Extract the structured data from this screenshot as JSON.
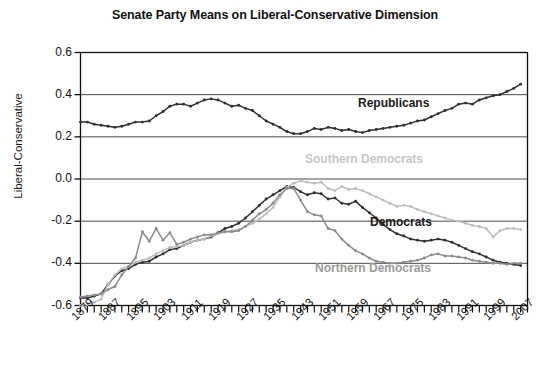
{
  "chart_data": {
    "type": "line",
    "title": "Senate Party Means on Liberal-Conservative Dimension",
    "xlabel": "",
    "ylabel": "Liberal-Conservative",
    "ylim": [
      -0.6,
      0.6
    ],
    "yticks": [
      "0.6",
      "0.4",
      "0.2",
      "0.0",
      "-0.2",
      "-0.4",
      "-0.6"
    ],
    "ytick_values": [
      0.6,
      0.4,
      0.2,
      0.0,
      -0.2,
      -0.4,
      -0.6
    ],
    "xlim": [
      1879,
      2009
    ],
    "xtick_labels": [
      "1879",
      "1887",
      "1895",
      "1903",
      "1911",
      "1919",
      "1927",
      "1935",
      "1943",
      "1951",
      "1959",
      "1967",
      "1975",
      "1983",
      "1991",
      "1999",
      "2007"
    ],
    "xtick_values": [
      1879,
      1887,
      1895,
      1903,
      1911,
      1919,
      1927,
      1935,
      1943,
      1951,
      1959,
      1967,
      1975,
      1983,
      1991,
      1999,
      2007
    ],
    "x_step_years": 2,
    "grid": "horizontal",
    "legend_position": "inline-annotations",
    "markers": "small-filled-circles",
    "x": [
      1879,
      1881,
      1883,
      1885,
      1887,
      1889,
      1891,
      1893,
      1895,
      1897,
      1899,
      1901,
      1903,
      1905,
      1907,
      1909,
      1911,
      1913,
      1915,
      1917,
      1919,
      1921,
      1923,
      1925,
      1927,
      1929,
      1931,
      1933,
      1935,
      1937,
      1939,
      1941,
      1943,
      1945,
      1947,
      1949,
      1951,
      1953,
      1955,
      1957,
      1959,
      1961,
      1963,
      1965,
      1967,
      1969,
      1971,
      1973,
      1975,
      1977,
      1979,
      1981,
      1983,
      1985,
      1987,
      1989,
      1991,
      1993,
      1995,
      1997,
      1999,
      2001,
      2003,
      2005,
      2007
    ],
    "series": [
      {
        "name": "Republicans",
        "color": "#303030",
        "label_color": "#1a1a1a",
        "values": [
          0.27,
          0.27,
          0.26,
          0.255,
          0.25,
          0.245,
          0.25,
          0.26,
          0.27,
          0.27,
          0.275,
          0.3,
          0.32,
          0.345,
          0.355,
          0.355,
          0.345,
          0.36,
          0.375,
          0.38,
          0.375,
          0.36,
          0.345,
          0.35,
          0.335,
          0.325,
          0.3,
          0.275,
          0.26,
          0.245,
          0.225,
          0.215,
          0.215,
          0.225,
          0.24,
          0.235,
          0.245,
          0.24,
          0.23,
          0.235,
          0.225,
          0.22,
          0.23,
          0.235,
          0.24,
          0.245,
          0.25,
          0.255,
          0.265,
          0.275,
          0.28,
          0.295,
          0.31,
          0.325,
          0.335,
          0.355,
          0.36,
          0.355,
          0.375,
          0.385,
          0.395,
          0.4,
          0.415,
          0.43,
          0.45
        ]
      },
      {
        "name": "Democrats",
        "color": "#303030",
        "label_color": "#1a1a1a",
        "values": [
          -0.565,
          -0.565,
          -0.555,
          -0.545,
          -0.5,
          -0.46,
          -0.435,
          -0.425,
          -0.405,
          -0.395,
          -0.39,
          -0.37,
          -0.355,
          -0.335,
          -0.33,
          -0.315,
          -0.3,
          -0.29,
          -0.285,
          -0.275,
          -0.255,
          -0.235,
          -0.225,
          -0.21,
          -0.185,
          -0.155,
          -0.125,
          -0.095,
          -0.075,
          -0.055,
          -0.035,
          -0.04,
          -0.06,
          -0.075,
          -0.065,
          -0.07,
          -0.095,
          -0.09,
          -0.115,
          -0.12,
          -0.105,
          -0.135,
          -0.16,
          -0.185,
          -0.215,
          -0.24,
          -0.26,
          -0.27,
          -0.285,
          -0.29,
          -0.295,
          -0.29,
          -0.285,
          -0.29,
          -0.3,
          -0.315,
          -0.33,
          -0.345,
          -0.355,
          -0.37,
          -0.385,
          -0.395,
          -0.4,
          -0.405,
          -0.41
        ]
      },
      {
        "name": "Southern Democrats",
        "color": "#bdbdbd",
        "label_color": "#c6c6c6",
        "values": [
          -0.6,
          -0.595,
          -0.585,
          -0.57,
          -0.5,
          -0.455,
          -0.425,
          -0.415,
          -0.395,
          -0.385,
          -0.375,
          -0.355,
          -0.34,
          -0.325,
          -0.32,
          -0.315,
          -0.3,
          -0.29,
          -0.285,
          -0.27,
          -0.26,
          -0.25,
          -0.245,
          -0.24,
          -0.225,
          -0.21,
          -0.19,
          -0.165,
          -0.135,
          -0.085,
          -0.04,
          -0.02,
          -0.01,
          -0.015,
          -0.02,
          -0.015,
          -0.045,
          -0.055,
          -0.035,
          -0.05,
          -0.045,
          -0.055,
          -0.07,
          -0.085,
          -0.1,
          -0.115,
          -0.13,
          -0.125,
          -0.13,
          -0.145,
          -0.155,
          -0.165,
          -0.175,
          -0.185,
          -0.195,
          -0.2,
          -0.21,
          -0.22,
          -0.225,
          -0.235,
          -0.275,
          -0.245,
          -0.235,
          -0.235,
          -0.24
        ]
      },
      {
        "name": "Northern Democrats",
        "color": "#8c8c8c",
        "label_color": "#9b9b9b",
        "values": [
          -0.56,
          -0.555,
          -0.55,
          -0.545,
          -0.525,
          -0.51,
          -0.455,
          -0.415,
          -0.375,
          -0.25,
          -0.295,
          -0.235,
          -0.29,
          -0.255,
          -0.31,
          -0.3,
          -0.285,
          -0.275,
          -0.265,
          -0.265,
          -0.255,
          -0.25,
          -0.25,
          -0.245,
          -0.225,
          -0.195,
          -0.165,
          -0.145,
          -0.115,
          -0.075,
          -0.045,
          -0.045,
          -0.1,
          -0.155,
          -0.17,
          -0.175,
          -0.235,
          -0.245,
          -0.285,
          -0.315,
          -0.34,
          -0.355,
          -0.375,
          -0.39,
          -0.395,
          -0.4,
          -0.4,
          -0.395,
          -0.39,
          -0.385,
          -0.375,
          -0.36,
          -0.355,
          -0.365,
          -0.365,
          -0.37,
          -0.375,
          -0.385,
          -0.39,
          -0.395,
          -0.4,
          -0.4,
          -0.405,
          -0.4,
          -0.4
        ]
      }
    ],
    "annotations": [
      {
        "text": "Republicans",
        "x_px": 358,
        "y_px": 96,
        "color": "#1a1a1a"
      },
      {
        "text": "Southern Democrats",
        "x_px": 305,
        "y_px": 152,
        "color": "#c6c6c6"
      },
      {
        "text": "Democrats",
        "x_px": 370,
        "y_px": 215,
        "color": "#1a1a1a"
      },
      {
        "text": "Northern Democrats",
        "x_px": 315,
        "y_px": 261,
        "color": "#9b9b9b"
      }
    ]
  }
}
